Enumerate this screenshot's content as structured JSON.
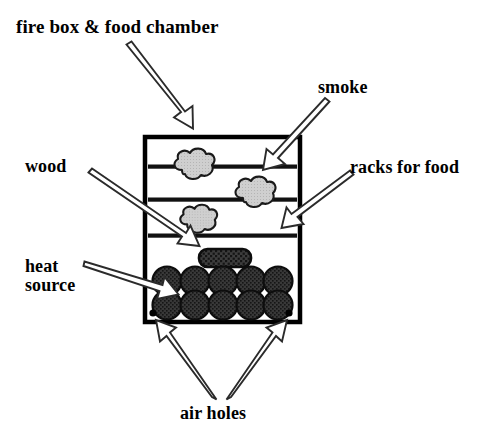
{
  "diagram": {
    "title": "fire box & food chamber",
    "labels": {
      "fire_box": "fire box & food chamber",
      "smoke": "smoke",
      "wood": "wood",
      "racks": "racks for food",
      "heat_source": "heat\nsource",
      "heat_source_line1": "heat",
      "heat_source_line2": "source",
      "air_holes": "air holes"
    },
    "colors": {
      "ink": "#1a1a1a",
      "outline": "#000000",
      "background": "#ffffff",
      "smoke_fill": "#cccccc",
      "charcoal_fill": "#3a3a3a",
      "wood_fill": "#3a3a3a",
      "rack_stroke": "#000000",
      "arrow_fill": "#ffffff",
      "arrow_stroke": "#2b2b2b"
    },
    "counts": {
      "racks": 3,
      "smoke_clouds": 3,
      "charcoal_top_row": 5,
      "charcoal_bottom_row": 5,
      "air_holes": 2,
      "wood_pieces": 1,
      "callout_arrows": 6
    },
    "chamber": {
      "left": 145,
      "top": 137,
      "right": 300,
      "bottom": 322,
      "wall_thickness": 4
    },
    "racks_y": [
      167,
      200,
      236
    ],
    "air_holes_xy": [
      [
        153,
        313
      ],
      [
        288,
        313
      ]
    ]
  }
}
